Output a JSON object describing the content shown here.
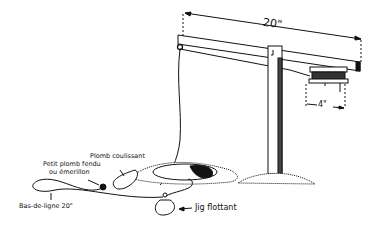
{
  "diagram": {
    "dimensions": {
      "arm_length": "20\"",
      "spool_width": "4\""
    },
    "labels": {
      "sliding_sinker": "Plomb coulissant",
      "split_shot_line1": "Petit plomb fendu",
      "split_shot_line2": "ou émerillon",
      "leader": "Bas-de-ligne 20\"",
      "floating_jig": "Jig flottant"
    },
    "colors": {
      "ink": "#111111",
      "background": "#ffffff"
    }
  }
}
